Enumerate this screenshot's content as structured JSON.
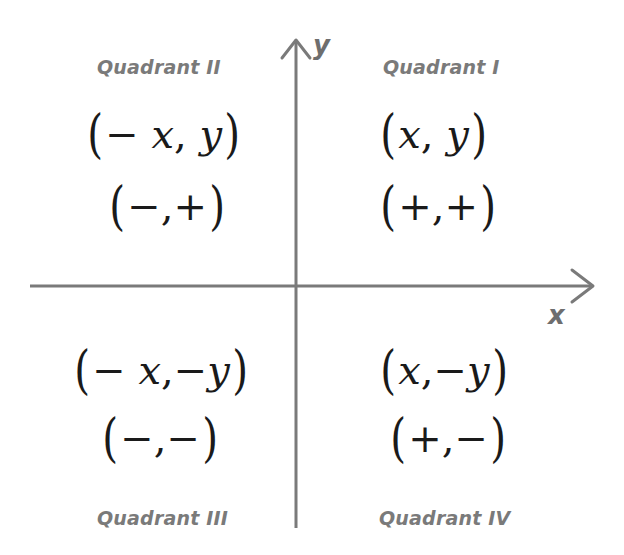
{
  "diagram": {
    "type": "cartesian-quadrants",
    "colors": {
      "axis": "#7a7a7a",
      "quadrant_label": "#7a7a7a",
      "coordinate_text": "#1a1a1a",
      "background": "#ffffff"
    },
    "axes": {
      "x_label": "x",
      "y_label": "y"
    },
    "quadrants": [
      {
        "id": "I",
        "label": "Quadrant I",
        "coord": {
          "open": "(",
          "first": "x",
          "sep": ",",
          "second": "y",
          "close": ")"
        },
        "signs": {
          "open": "(",
          "first": "+",
          "sep": ",",
          "second": "+",
          "close": ")"
        }
      },
      {
        "id": "II",
        "label": "Quadrant II",
        "coord": {
          "open": "(",
          "first": "− x",
          "sep": ",",
          "second": "y",
          "close": ")"
        },
        "signs": {
          "open": "(",
          "first": "−",
          "sep": ",",
          "second": "+",
          "close": ")"
        }
      },
      {
        "id": "III",
        "label": "Quadrant III",
        "coord": {
          "open": "(",
          "first": "− x",
          "sep": ",",
          "second": "−y",
          "close": ")"
        },
        "signs": {
          "open": "(",
          "first": "−",
          "sep": ",",
          "second": "−",
          "close": ")"
        }
      },
      {
        "id": "IV",
        "label": "Quadrant IV",
        "coord": {
          "open": "(",
          "first": "x",
          "sep": ",",
          "second": "−y",
          "close": ")"
        },
        "signs": {
          "open": "(",
          "first": "+",
          "sep": ",",
          "second": "−",
          "close": ")"
        }
      }
    ]
  }
}
